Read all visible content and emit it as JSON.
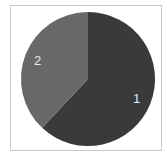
{
  "chart_data": {
    "type": "pie",
    "title": "",
    "categories": [
      "1",
      "2"
    ],
    "values": [
      62,
      38
    ],
    "colors": [
      "#3a3a3a",
      "#686868"
    ],
    "start_angle": "12 o'clock, clockwise",
    "legend": "none",
    "slice_labels": [
      "1",
      "2"
    ]
  },
  "labels": {
    "slice1": "1",
    "slice2": "2"
  }
}
